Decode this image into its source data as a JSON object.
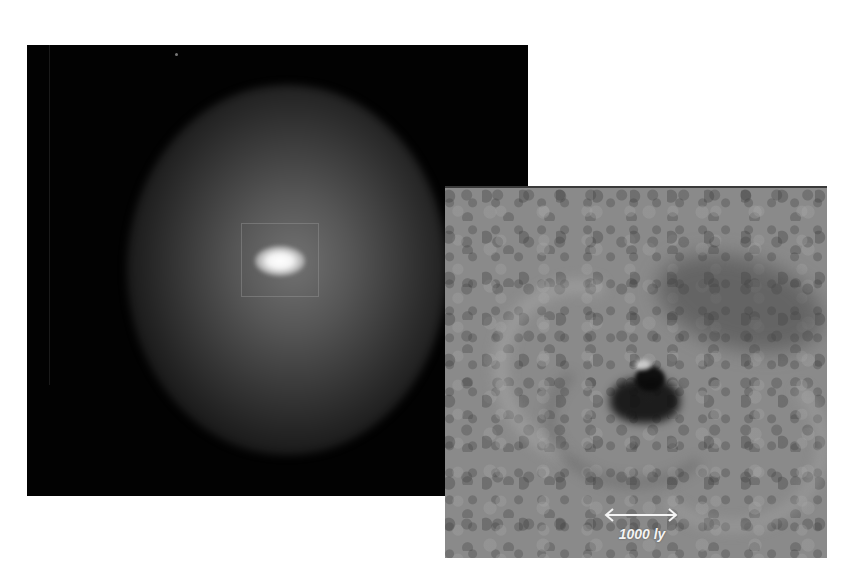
{
  "figure": {
    "left_panel": {
      "description": "Wide-field view of galaxy with bright elliptical core and boxed inset region",
      "inset_box": true
    },
    "right_panel": {
      "description": "Processed zoomed view of central region showing spiral structure around dark nucleus",
      "scale_bar": {
        "label": "1000 ly",
        "icon": "double-arrow-icon"
      }
    }
  }
}
